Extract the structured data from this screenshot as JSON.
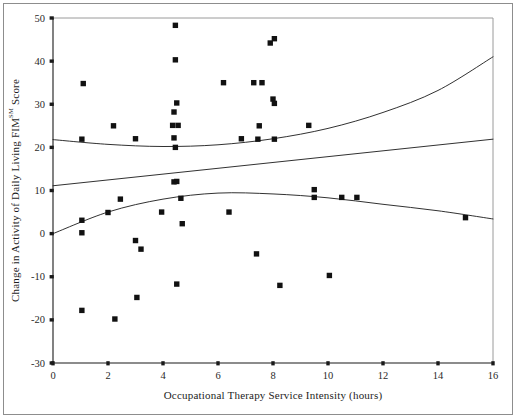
{
  "chart_data": {
    "type": "scatter",
    "title": "",
    "xlabel": "Occupational Therapy Service Intensity (hours)",
    "ylabel": "Change in Activity of Daily Living FIM",
    "ylabel_superscript": "SM",
    "ylabel_suffix": " Score",
    "xlim": [
      0,
      16
    ],
    "ylim": [
      -30,
      50
    ],
    "xticks": [
      0,
      2,
      4,
      6,
      8,
      10,
      12,
      14,
      16
    ],
    "yticks": [
      50,
      40,
      30,
      20,
      10,
      0,
      -10,
      -20,
      -30
    ],
    "xtick_labels": [
      "0",
      "2",
      "4",
      "6",
      "8",
      "10",
      "12",
      "14",
      "16"
    ],
    "ytick_labels": [
      "50",
      "40",
      "30",
      "20",
      "10",
      "0",
      "-10",
      "-20",
      "-30"
    ],
    "grid": false,
    "legend": "none",
    "marker": "filled-square",
    "marker_color": "#111111",
    "axis_color": "#1a1a1a",
    "frame_color": "#9a9a9a",
    "points": [
      [
        1.1,
        34.8
      ],
      [
        1.05,
        21.9
      ],
      [
        2.2,
        25.0
      ],
      [
        3.0,
        22.0
      ],
      [
        4.45,
        48.3
      ],
      [
        4.45,
        40.3
      ],
      [
        4.4,
        28.2
      ],
      [
        4.5,
        30.3
      ],
      [
        4.35,
        25.1
      ],
      [
        4.55,
        25.1
      ],
      [
        4.4,
        22.2
      ],
      [
        4.45,
        20.0
      ],
      [
        4.4,
        12.0
      ],
      [
        6.2,
        35.0
      ],
      [
        7.3,
        35.0
      ],
      [
        7.6,
        35.0
      ],
      [
        7.9,
        44.2
      ],
      [
        8.05,
        45.2
      ],
      [
        8.0,
        31.2
      ],
      [
        8.05,
        30.2
      ],
      [
        6.85,
        22.0
      ],
      [
        7.5,
        25.0
      ],
      [
        7.45,
        21.9
      ],
      [
        8.05,
        21.9
      ],
      [
        9.3,
        25.1
      ],
      [
        1.05,
        3.1
      ],
      [
        1.05,
        0.2
      ],
      [
        2.0,
        4.9
      ],
      [
        2.45,
        8.0
      ],
      [
        3.0,
        -1.6
      ],
      [
        3.2,
        -3.6
      ],
      [
        3.95,
        5.0
      ],
      [
        4.5,
        12.1
      ],
      [
        4.65,
        8.2
      ],
      [
        4.7,
        2.3
      ],
      [
        4.5,
        -11.7
      ],
      [
        3.05,
        -14.8
      ],
      [
        1.05,
        -17.8
      ],
      [
        2.25,
        -19.8
      ],
      [
        6.4,
        5.0
      ],
      [
        7.4,
        -4.7
      ],
      [
        8.25,
        -12.0
      ],
      [
        9.5,
        10.2
      ],
      [
        9.5,
        8.4
      ],
      [
        10.5,
        8.4
      ],
      [
        11.05,
        8.4
      ],
      [
        10.05,
        -9.7
      ],
      [
        15.0,
        3.7
      ]
    ],
    "trend_lines": [
      {
        "name": "upper-quadratic-curve",
        "description": "U-shaped quadratic fit through upper cluster",
        "points": [
          [
            0,
            21.8
          ],
          [
            2,
            20.7
          ],
          [
            4,
            20.2
          ],
          [
            6,
            20.6
          ],
          [
            8,
            22.0
          ],
          [
            10,
            24.4
          ],
          [
            12,
            28.1
          ],
          [
            14,
            33.2
          ],
          [
            16,
            41.0
          ]
        ]
      },
      {
        "name": "middle-linear-line",
        "description": "Nearly flat rising linear fit through middle",
        "points": [
          [
            0,
            11.1
          ],
          [
            16,
            21.9
          ]
        ]
      },
      {
        "name": "lower-quadratic-curve",
        "description": "Inverted-U quadratic fit through lower cluster",
        "points": [
          [
            0,
            0.0
          ],
          [
            2,
            5.0
          ],
          [
            4,
            8.0
          ],
          [
            6,
            9.4
          ],
          [
            8,
            9.2
          ],
          [
            10,
            8.3
          ],
          [
            12,
            6.8
          ],
          [
            14,
            5.3
          ],
          [
            16,
            3.4
          ]
        ]
      }
    ]
  },
  "figure": {
    "background_color": "#ffffff",
    "border_color": "#8d8d8d"
  }
}
